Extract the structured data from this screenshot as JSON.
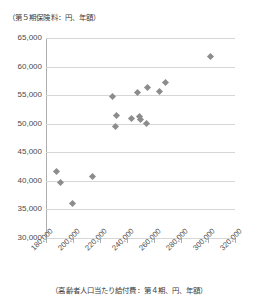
{
  "chart_data": {
    "type": "scatter",
    "title": "",
    "ylabel": "（第５期保険料：円、年額）",
    "xlabel": "（高齢者人口当たり給付費：第４期、円、年額）",
    "xlim": [
      180000,
      320000
    ],
    "ylim": [
      30000,
      65000
    ],
    "grid": true,
    "legend": null,
    "xticks": [
      "180,000",
      "200,000",
      "220,000",
      "240,000",
      "260,000",
      "280,000",
      "300,000",
      "320,000"
    ],
    "xtick_values": [
      180000,
      200000,
      220000,
      240000,
      260000,
      280000,
      300000,
      320000
    ],
    "yticks": [
      "30,000",
      "35,000",
      "40,000",
      "45,000",
      "50,000",
      "55,000",
      "60,000",
      "65,000"
    ],
    "ytick_values": [
      30000,
      35000,
      40000,
      45000,
      50000,
      55000,
      60000,
      65000
    ],
    "marker": "diamond",
    "marker_color": "#8c8c8c",
    "points": [
      {
        "x": 188000,
        "y": 41600
      },
      {
        "x": 190500,
        "y": 39700
      },
      {
        "x": 199500,
        "y": 36100
      },
      {
        "x": 214500,
        "y": 40800
      },
      {
        "x": 229500,
        "y": 54700
      },
      {
        "x": 231500,
        "y": 49500
      },
      {
        "x": 232500,
        "y": 51400
      },
      {
        "x": 243500,
        "y": 50900
      },
      {
        "x": 248000,
        "y": 55400
      },
      {
        "x": 249500,
        "y": 51300
      },
      {
        "x": 250000,
        "y": 50800
      },
      {
        "x": 254500,
        "y": 50000
      },
      {
        "x": 255500,
        "y": 56400
      },
      {
        "x": 264000,
        "y": 55600
      },
      {
        "x": 268500,
        "y": 57200
      },
      {
        "x": 302000,
        "y": 61800
      }
    ]
  }
}
